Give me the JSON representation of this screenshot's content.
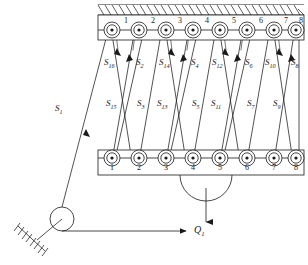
{
  "diagram": {
    "type": "mechanical-schematic",
    "colors": {
      "line": "#1a1a1a",
      "background": "#ffffff",
      "hatch": "#1a1a1a"
    },
    "upper_block": {
      "name": "fixed-upper-block",
      "x": 98,
      "y": 15,
      "width": 206,
      "height": 25,
      "sheave_numbers": [
        "1",
        "2",
        "3",
        "4",
        "5",
        "6",
        "7",
        "8"
      ],
      "sheave_cx": [
        112,
        139,
        166,
        193,
        220,
        247,
        274,
        296
      ],
      "sheave_cy": 30
    },
    "lower_block": {
      "name": "movable-lower-block",
      "x": 98,
      "y": 150,
      "width": 206,
      "height": 25,
      "sheave_numbers": [
        "1",
        "2",
        "3",
        "4",
        "5",
        "6",
        "7",
        "8"
      ],
      "sheave_cx": [
        112,
        139,
        166,
        193,
        220,
        247,
        274,
        296
      ],
      "sheave_cy": 158
    },
    "ceiling": {
      "name": "hatched-ceiling",
      "x": 98,
      "y": 4,
      "width": 206,
      "height": 11,
      "hatch_spacing": 7,
      "hatch_angle_deg": 55
    },
    "rope_labels_upper": [
      {
        "text": "S",
        "sub": "16",
        "x": 104,
        "y": 58
      },
      {
        "text": "S",
        "sub": "2",
        "x": 136,
        "y": 58
      },
      {
        "text": "S",
        "sub": "14",
        "x": 159,
        "y": 58
      },
      {
        "text": "S",
        "sub": "4",
        "x": 191,
        "y": 58
      },
      {
        "text": "S",
        "sub": "12",
        "x": 213,
        "y": 58
      },
      {
        "text": "S",
        "sub": "6",
        "x": 245,
        "y": 58
      },
      {
        "text": "S",
        "sub": "10",
        "x": 266,
        "y": 58
      },
      {
        "text": "S",
        "sub": "8",
        "x": 291,
        "y": 58
      }
    ],
    "rope_labels_lower": [
      {
        "text": "S",
        "sub": "15",
        "x": 106,
        "y": 99
      },
      {
        "text": "S",
        "sub": "3",
        "x": 137,
        "y": 99
      },
      {
        "text": "S",
        "sub": "13",
        "x": 158,
        "y": 99
      },
      {
        "text": "S",
        "sub": "5",
        "x": 192,
        "y": 99
      },
      {
        "text": "S",
        "sub": "11",
        "x": 212,
        "y": 99
      },
      {
        "text": "S",
        "sub": "7",
        "x": 247,
        "y": 99
      },
      {
        "text": "S",
        "sub": "9",
        "x": 273,
        "y": 99
      }
    ],
    "lead_rope": {
      "name": "lead-rope-s1",
      "text": "S",
      "sub": "1",
      "label_x": 55,
      "label_y": 104,
      "from_x": 112,
      "from_y": 30,
      "to_x": 62,
      "to_y": 219
    },
    "deflection_pulley": {
      "name": "deflection-pulley",
      "cx": 62,
      "cy": 219,
      "r": 12
    },
    "ground_support": {
      "name": "ground-support-hatched",
      "anchor_x": 62,
      "anchor_y": 219,
      "base_x1": 18,
      "base_y1": 227,
      "base_x2": 50,
      "base_y2": 253,
      "hatch_count": 9
    },
    "load": {
      "name": "load-arrow",
      "text": "Q",
      "sub": "1",
      "label_x": 198,
      "label_y": 227,
      "arrow_from_x": 62,
      "arrow_from_y": 231,
      "arrow_to_x": 190,
      "arrow_to_y": 231
    },
    "hook": {
      "name": "load-hook",
      "arc_cx": 206,
      "arc_cy": 175,
      "arc_r": 26,
      "shaft_x": 206,
      "shaft_y1": 201,
      "shaft_y2": 224
    }
  }
}
